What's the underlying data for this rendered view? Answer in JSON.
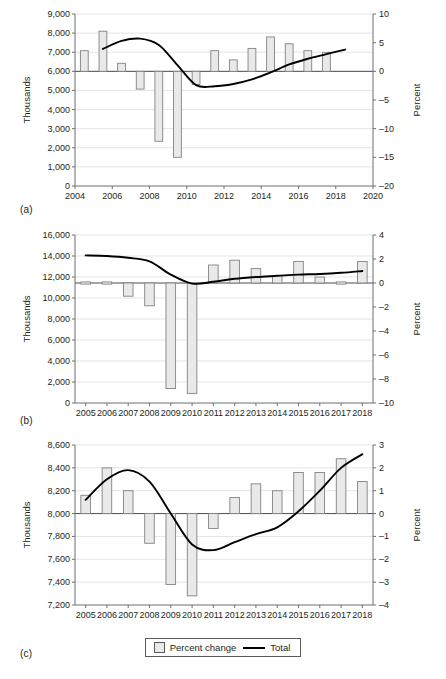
{
  "figure": {
    "panel_labels": {
      "a": "(a)",
      "b": "(b)",
      "c": "(c)"
    },
    "legend": {
      "bar_label": "Percent change",
      "line_label": "Total"
    },
    "colors": {
      "bar_fill": "#e9e9e9",
      "bar_stroke": "#808285",
      "line": "#000000",
      "axis": "#6d6e71",
      "grid": "#d9d9d9",
      "text": "#231f20"
    }
  },
  "chart_data": [
    {
      "type": "bar",
      "panel": "(a)",
      "title": "",
      "xlabel": "",
      "ylabel": "Thousands",
      "y2label": "Percent",
      "grid": true,
      "legend_position": "bottom",
      "x": [
        2004,
        2005,
        2006,
        2007,
        2008,
        2009,
        2010,
        2011,
        2012,
        2013,
        2014,
        2015,
        2016,
        2017,
        2018,
        2019
      ],
      "xlim": [
        2004,
        2020
      ],
      "xticks": [
        2004,
        2006,
        2008,
        2010,
        2012,
        2014,
        2016,
        2018,
        2020
      ],
      "xticklabels": [
        "2004",
        "2006",
        "2008",
        "2010",
        "2012",
        "2014",
        "2016",
        "2018",
        "2020"
      ],
      "ylim": [
        0,
        9000
      ],
      "yticks": [
        0,
        1000,
        2000,
        3000,
        4000,
        5000,
        6000,
        7000,
        8000,
        9000
      ],
      "yticklabels": [
        "0",
        "1,000",
        "2,000",
        "3,000",
        "4,000",
        "5,000",
        "6,000",
        "7,000",
        "8,000",
        "9,000"
      ],
      "ylim2": [
        -20,
        10
      ],
      "yticks2": [
        -20,
        -15,
        -10,
        -5,
        0,
        5,
        10
      ],
      "yticklabels2": [
        "–20",
        "–15",
        "–10",
        "–5",
        "0",
        "5",
        "10"
      ],
      "series": [
        {
          "name": "Percent change",
          "kind": "bar",
          "axis": "right",
          "values": [
            3.6,
            7.0,
            1.4,
            -3.1,
            -12.2,
            -15.0,
            -2.3,
            3.6,
            2.0,
            4.0,
            6.0,
            4.8,
            3.6,
            3.3,
            null,
            null
          ]
        },
        {
          "name": "Total",
          "kind": "line",
          "axis": "right",
          "x": [
            2005,
            2006,
            2007,
            2008,
            2009,
            2010,
            2011,
            2012,
            2013,
            2014,
            2015,
            2016,
            2017,
            2018
          ],
          "values": [
            3.9,
            5.3,
            5.7,
            4.6,
            1.1,
            -2.4,
            -2.6,
            -2.2,
            -1.4,
            -0.2,
            1.2,
            2.2,
            3.0,
            3.8
          ]
        }
      ]
    },
    {
      "type": "bar",
      "panel": "(b)",
      "title": "",
      "xlabel": "",
      "ylabel": "Thousands",
      "y2label": "Percent",
      "grid": true,
      "legend_position": "bottom",
      "x": [
        2005,
        2006,
        2007,
        2008,
        2009,
        2010,
        2011,
        2012,
        2013,
        2014,
        2015,
        2016,
        2017,
        2018
      ],
      "xlim": [
        2004.5,
        2018.5
      ],
      "xticks": [
        2005,
        2006,
        2007,
        2008,
        2009,
        2010,
        2011,
        2012,
        2013,
        2014,
        2015,
        2016,
        2017,
        2018
      ],
      "xticklabels": [
        "2005",
        "2006",
        "2007",
        "2008",
        "2009",
        "2010",
        "2011",
        "2012",
        "2013",
        "2014",
        "2015",
        "2016",
        "2017",
        "2018"
      ],
      "ylim": [
        0,
        16000
      ],
      "yticks": [
        0,
        2000,
        4000,
        6000,
        8000,
        10000,
        12000,
        14000,
        16000
      ],
      "yticklabels": [
        "0",
        "2,000",
        "4,000",
        "6,000",
        "8,000",
        "10,000",
        "12,000",
        "14,000",
        "16,000"
      ],
      "ylim2": [
        -10,
        4
      ],
      "yticks2": [
        -10,
        -8,
        -6,
        -4,
        -2,
        0,
        2,
        4
      ],
      "yticklabels2": [
        "–10",
        "–8",
        "–6",
        "–4",
        "–2",
        "0",
        "2",
        "4"
      ],
      "series": [
        {
          "name": "Percent change",
          "kind": "bar",
          "axis": "right",
          "values": [
            -0.05,
            -0.08,
            -1.1,
            -1.9,
            -8.8,
            -9.2,
            1.5,
            1.9,
            1.2,
            0.6,
            1.8,
            0.5,
            -0.03,
            1.8
          ]
        },
        {
          "name": "Total",
          "kind": "line",
          "axis": "right",
          "x": [
            2005,
            2006,
            2007,
            2008,
            2009,
            2010,
            2011,
            2012,
            2013,
            2014,
            2015,
            2016,
            2017,
            2018
          ],
          "values": [
            2.3,
            2.25,
            2.1,
            1.8,
            0.7,
            -0.05,
            0.1,
            0.35,
            0.5,
            0.6,
            0.7,
            0.75,
            0.85,
            1.0
          ]
        }
      ]
    },
    {
      "type": "bar",
      "panel": "(c)",
      "title": "",
      "xlabel": "",
      "ylabel": "Thousands",
      "y2label": "Percent",
      "grid": true,
      "legend_position": "bottom",
      "x": [
        2005,
        2006,
        2007,
        2008,
        2009,
        2010,
        2011,
        2012,
        2013,
        2014,
        2015,
        2016,
        2017,
        2018
      ],
      "xlim": [
        2004.5,
        2018.5
      ],
      "xticks": [
        2005,
        2006,
        2007,
        2008,
        2009,
        2010,
        2011,
        2012,
        2013,
        2014,
        2015,
        2016,
        2017,
        2018
      ],
      "xticklabels": [
        "2005",
        "2006",
        "2007",
        "2008",
        "2009",
        "2010",
        "2011",
        "2012",
        "2013",
        "2014",
        "2015",
        "2016",
        "2017",
        "2018"
      ],
      "ylim": [
        7200,
        8600
      ],
      "yticks": [
        7200,
        7400,
        7600,
        7800,
        8000,
        8200,
        8400,
        8600
      ],
      "yticklabels": [
        "7,200",
        "7,400",
        "7,600",
        "7,800",
        "8,000",
        "8,200",
        "8,400",
        "8,600"
      ],
      "ylim2": [
        -4,
        3
      ],
      "yticks2": [
        -4,
        -3,
        -2,
        -1,
        0,
        1,
        2,
        3
      ],
      "yticklabels2": [
        "–4",
        "–3",
        "–2",
        "–1",
        "0",
        "1",
        "2",
        "3"
      ],
      "series": [
        {
          "name": "Percent change",
          "kind": "bar",
          "axis": "right",
          "values": [
            0.8,
            2.0,
            1.0,
            -1.3,
            -3.1,
            -3.6,
            -0.65,
            0.7,
            1.3,
            1.0,
            1.8,
            1.8,
            2.4,
            1.4
          ]
        },
        {
          "name": "Total",
          "kind": "line",
          "axis": "right",
          "x": [
            2005,
            2006,
            2007,
            2008,
            2009,
            2010,
            2011,
            2012,
            2013,
            2014,
            2015,
            2016,
            2017,
            2018
          ],
          "values": [
            0.6,
            1.5,
            1.9,
            1.4,
            0.0,
            -1.35,
            -1.6,
            -1.25,
            -0.9,
            -0.6,
            0.1,
            1.0,
            2.0,
            2.6
          ]
        }
      ]
    }
  ]
}
